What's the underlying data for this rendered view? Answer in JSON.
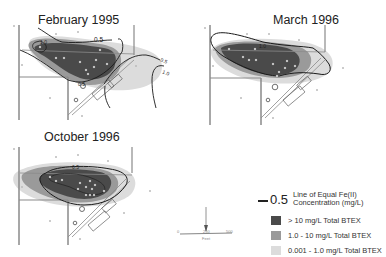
{
  "panels": [
    {
      "id": "feb1995",
      "title": "February 1995",
      "contour_labels": [
        "0.5",
        "1.0",
        "0.5",
        "0.5",
        "0.5",
        "1.0"
      ]
    },
    {
      "id": "mar1996",
      "title": "March 1996",
      "contour_labels": [
        "1.0"
      ]
    },
    {
      "id": "oct1996",
      "title": "October 1996",
      "contour_labels": [
        "0.5"
      ]
    }
  ],
  "legend": {
    "line_value": "0.5",
    "line_desc_1": "Line of Equal Fe(II)",
    "line_desc_2": "Concentration (mg/L)",
    "items": [
      {
        "label": "> 10 mg/L Total BTEX",
        "color": "#4a4a4a"
      },
      {
        "label": "1.0 - 10 mg/L Total BTEX",
        "color": "#9a9a9a"
      },
      {
        "label": "0.001 - 1.0 mg/L Total BTEX",
        "color": "#dcdcdc"
      }
    ]
  },
  "scale_bar": {
    "start": "0",
    "mid": "250",
    "end": "500",
    "unit": "Feet",
    "north_arrow": "north-arrow"
  },
  "colors": {
    "high": "#4a4a4a",
    "mid": "#9a9a9a",
    "low": "#dcdcdc",
    "contour": "#1a1a1a",
    "road": "#8a8a8a",
    "well": "#f4f4f4"
  }
}
